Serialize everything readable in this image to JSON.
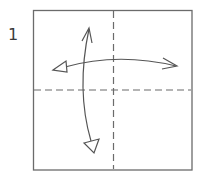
{
  "step": {
    "number": "1"
  },
  "diagram": {
    "type": "origami-fold-instruction",
    "colors": {
      "paper_border": "#6b6b6b",
      "crease_line": "#6b6b6b",
      "arrow": "#555555",
      "background": "#ffffff"
    },
    "paper_square": {
      "x": 33,
      "y": 10,
      "width": 159,
      "height": 160
    },
    "crease_lines": [
      {
        "orientation": "vertical",
        "style": "valley-fold-dashed",
        "position": 113.5
      },
      {
        "orientation": "horizontal",
        "style": "valley-fold-dashed",
        "position": 90
      }
    ],
    "arrows": [
      {
        "name": "horizontal-fold-unfold-arrow",
        "from": "right",
        "to": "left",
        "meaning": "fold and unfold"
      },
      {
        "name": "vertical-fold-unfold-arrow",
        "from": "top",
        "to": "bottom",
        "meaning": "fold and unfold"
      }
    ]
  }
}
